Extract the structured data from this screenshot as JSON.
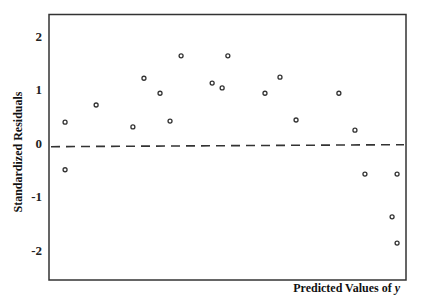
{
  "chart_data": {
    "type": "scatter",
    "title": "",
    "xlabel": "Predicted Values of",
    "xlabel_italic_var": "y",
    "ylabel": "Standardized Residuals",
    "xlim": [
      0,
      100
    ],
    "ylim": [
      -2.6,
      2.41
    ],
    "yticks": [
      2,
      1,
      0,
      -1,
      -2
    ],
    "ytick_labels": [
      "2",
      "1",
      "0",
      "-1",
      "-2"
    ],
    "xticks": [],
    "grid": false,
    "legend": null,
    "reference_line": {
      "y": -0.05,
      "style": "dashed",
      "color": "#333333"
    },
    "marker": {
      "shape": "open-circle",
      "color": "#333333",
      "radius": 2
    },
    "series": [
      {
        "name": "residuals",
        "points": [
          {
            "x": 4.5,
            "y": 0.39
          },
          {
            "x": 4.5,
            "y": -0.5
          },
          {
            "x": 13.2,
            "y": 0.71
          },
          {
            "x": 23.5,
            "y": 0.3
          },
          {
            "x": 26.6,
            "y": 1.21
          },
          {
            "x": 31.1,
            "y": 0.93
          },
          {
            "x": 33.9,
            "y": 0.41
          },
          {
            "x": 37.0,
            "y": 1.63
          },
          {
            "x": 45.7,
            "y": 1.12
          },
          {
            "x": 48.5,
            "y": 1.03
          },
          {
            "x": 50.1,
            "y": 1.63
          },
          {
            "x": 60.5,
            "y": 0.93
          },
          {
            "x": 64.7,
            "y": 1.23
          },
          {
            "x": 69.2,
            "y": 0.43
          },
          {
            "x": 81.2,
            "y": 0.93
          },
          {
            "x": 85.7,
            "y": 0.24
          },
          {
            "x": 88.5,
            "y": -0.58
          },
          {
            "x": 97.5,
            "y": -0.58
          },
          {
            "x": 96.1,
            "y": -1.38
          },
          {
            "x": 97.5,
            "y": -1.87
          }
        ]
      }
    ]
  },
  "colors": {
    "axis": "#333333",
    "marker": "#333333",
    "background": "#ffffff"
  }
}
